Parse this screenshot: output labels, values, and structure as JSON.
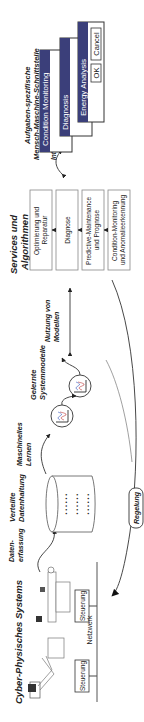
{
  "diagram": {
    "orientation": "rotated 90deg counter-clockwise",
    "cps": {
      "title": "Cyber-Physisches Systems",
      "controllers": [
        "Steuerung",
        "Steuerung"
      ],
      "network_label": "Netzwerk"
    },
    "data_capture_label": "Daten-\nerfassung",
    "data_capture_lines": [
      "Daten-",
      "erfassung"
    ],
    "storage": {
      "title_lines": [
        "Verteilte",
        "Datenhaltung"
      ]
    },
    "machine_learning_lines": [
      "Maschinelles",
      "Lernen"
    ],
    "models": {
      "title_lines": [
        "Gelernte",
        "Systemmodelle"
      ]
    },
    "model_usage_lines": [
      "Nutzung von",
      "Modellen"
    ],
    "control_label": "Regelung",
    "services": {
      "title_lines": [
        "Services und",
        "Algorithmen"
      ],
      "boxes": [
        [
          "Optimierung und",
          "Reparatur"
        ],
        [
          "Diagnose"
        ],
        [
          "Predictive-Maintenance",
          "und Prognose"
        ],
        [
          "Condition-Monitoring",
          "und Anomalieerkennung"
        ]
      ]
    },
    "interaction_label": "Interaktion",
    "hmi": {
      "title_lines": [
        "Aufgaben-spezifische",
        "Mensch-Maschine-Schnittstelle"
      ],
      "windows": [
        "Condition Monitoring",
        "Diagnosis",
        "Energy Analysis"
      ],
      "buttons": {
        "ok": "OK",
        "cancel": "Cancel"
      },
      "titlebar_color": "#3b3f7a"
    }
  }
}
